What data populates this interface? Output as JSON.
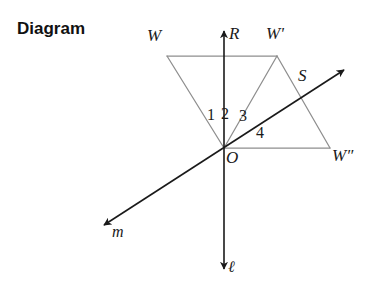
{
  "title": "Diagram",
  "figure": {
    "type": "geometry-diagram",
    "colors": {
      "shape_stroke": "#8e8e8e",
      "line_stroke": "#1a1a1a",
      "text": "#1a1a1a",
      "title": "#111111",
      "background": "#ffffff"
    },
    "points": [
      {
        "name": "W",
        "label": "W",
        "x": 167,
        "y": 56,
        "label_x": 147,
        "label_y": 27
      },
      {
        "name": "Wp",
        "label": "W'",
        "x": 277,
        "y": 56,
        "label_x": 266,
        "label_y": 25
      },
      {
        "name": "Wpp",
        "label": "W″",
        "x": 330,
        "y": 148,
        "label_x": 332,
        "label_y": 147
      },
      {
        "name": "O",
        "label": "O",
        "x": 224,
        "y": 148,
        "label_x": 226,
        "label_y": 149
      },
      {
        "name": "R",
        "label": "R",
        "x": 224,
        "y": 27,
        "label_x": 229,
        "label_y": 25
      },
      {
        "name": "S",
        "label": "S",
        "x": 305,
        "y": 92,
        "label_x": 298,
        "label_y": 67
      }
    ],
    "lines": [
      {
        "name": "line-l",
        "label": "ℓ",
        "label_x": 228,
        "label_y": 259,
        "x1": 224,
        "y1": 27,
        "x2": 224,
        "y2": 273,
        "arrow_start": true,
        "arrow_end": true
      },
      {
        "name": "line-m",
        "label": "m",
        "label_x": 112,
        "label_y": 224,
        "x1": 348,
        "y1": 68,
        "x2": 100,
        "y2": 228,
        "arrow_start": true,
        "arrow_end": true
      }
    ],
    "segments": [
      {
        "name": "segment-W-Wp",
        "x1": 167,
        "y1": 56,
        "x2": 277,
        "y2": 56
      },
      {
        "name": "segment-W-O",
        "x1": 167,
        "y1": 56,
        "x2": 224,
        "y2": 148
      },
      {
        "name": "segment-Wp-O",
        "x1": 277,
        "y1": 56,
        "x2": 224,
        "y2": 148
      },
      {
        "name": "segment-Wp-Wpp",
        "x1": 277,
        "y1": 56,
        "x2": 330,
        "y2": 148
      },
      {
        "name": "segment-O-Wpp",
        "x1": 224,
        "y1": 148,
        "x2": 330,
        "y2": 148
      }
    ],
    "angle_labels": [
      {
        "name": "angle-1",
        "label": "1",
        "x": 207,
        "y": 107
      },
      {
        "name": "angle-2",
        "label": "2",
        "x": 221,
        "y": 106
      },
      {
        "name": "angle-3",
        "label": "3",
        "x": 239,
        "y": 108
      },
      {
        "name": "angle-4",
        "label": "4",
        "x": 256,
        "y": 125
      }
    ]
  }
}
